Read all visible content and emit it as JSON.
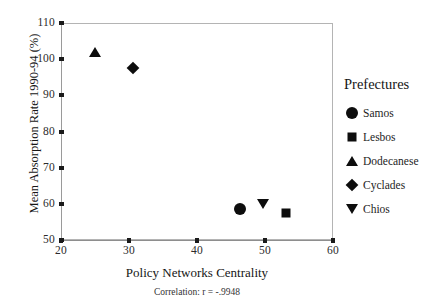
{
  "chart_data": {
    "type": "scatter",
    "title": "",
    "xlabel": "Policy Networks Centrality",
    "ylabel": "Mean Absorption Rate 1990-94 (%)",
    "annotation": "Correlation: r = -.9948",
    "xlim": [
      20,
      60
    ],
    "ylim": [
      50,
      110
    ],
    "xticks": [
      "20",
      "30",
      "40",
      "50",
      "60"
    ],
    "xtick_values": [
      20,
      30,
      40,
      50,
      60
    ],
    "yticks": [
      "50",
      "60",
      "70",
      "80",
      "90",
      "100",
      "110"
    ],
    "ytick_values": [
      50,
      60,
      70,
      80,
      90,
      100,
      110
    ],
    "grid": false,
    "legend_position": "right",
    "legend_title": "Prefectures",
    "points": [
      {
        "name": "Samos",
        "marker": "circle",
        "x": 46.3,
        "y": 58.5
      },
      {
        "name": "Lesbos",
        "marker": "square",
        "x": 53.1,
        "y": 57.5
      },
      {
        "name": "Dodecanese",
        "marker": "triangle-up",
        "x": 25.0,
        "y": 102.0
      },
      {
        "name": "Cyclades",
        "marker": "diamond",
        "x": 30.6,
        "y": 97.5
      },
      {
        "name": "Chios",
        "marker": "triangle-down",
        "x": 49.7,
        "y": 60.0
      }
    ]
  },
  "legend": {
    "title": "Prefectures",
    "items": [
      {
        "label": "Samos",
        "marker": "circle"
      },
      {
        "label": "Lesbos",
        "marker": "square"
      },
      {
        "label": "Dodecanese",
        "marker": "triangle-up"
      },
      {
        "label": "Cyclades",
        "marker": "diamond"
      },
      {
        "label": "Chios",
        "marker": "triangle-down"
      }
    ]
  }
}
